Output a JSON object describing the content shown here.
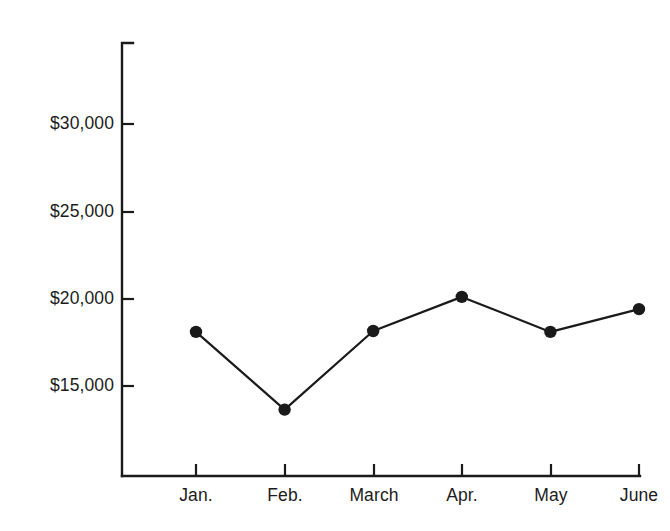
{
  "chart_data": {
    "type": "line",
    "title": "",
    "subtitle": "",
    "xlabel": "",
    "ylabel": "",
    "categories": [
      "Jan.",
      "Feb.",
      "March",
      "Apr.",
      "May",
      "June"
    ],
    "values": [
      18100,
      13650,
      18150,
      20100,
      18100,
      19400
    ],
    "series": [
      {
        "name": "",
        "values": [
          18100,
          13650,
          18150,
          20100,
          18100,
          19400
        ]
      }
    ],
    "ytick_labels": [
      "$30,000",
      "$25,000",
      "$20,000",
      "$15,000"
    ],
    "ytick_values": [
      30000,
      25000,
      20000,
      15000
    ],
    "ylim": [
      11500,
      32500
    ],
    "grid": false,
    "legend": false,
    "legend_position": "none",
    "marker": "circle",
    "line_color": "#1a1a1a",
    "marker_color": "#1a1a1a",
    "background_color": "#ffffff",
    "axis_color": "#1a1a1a"
  },
  "axes": {
    "y_axis_name": "dollar-axis",
    "x_axis_name": "month-axis"
  }
}
